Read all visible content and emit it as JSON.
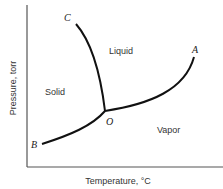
{
  "diagram": {
    "type": "phase-diagram",
    "axes": {
      "xlabel": "Temperature, °C",
      "ylabel": "Pressure, torr"
    },
    "regions": {
      "solid": "Solid",
      "liquid": "Liquid",
      "vapor": "Vapor"
    },
    "points": {
      "A": "A",
      "B": "B",
      "C": "C",
      "O": "O"
    },
    "curves": [
      {
        "name": "OA",
        "from": "O",
        "to": "A",
        "description": "vaporization curve"
      },
      {
        "name": "OB",
        "from": "B",
        "to": "O",
        "description": "sublimation curve"
      },
      {
        "name": "OC",
        "from": "O",
        "to": "C",
        "description": "fusion curve"
      }
    ],
    "colors": {
      "line": "#111111",
      "text": "#333333",
      "background": "#ffffff"
    }
  }
}
